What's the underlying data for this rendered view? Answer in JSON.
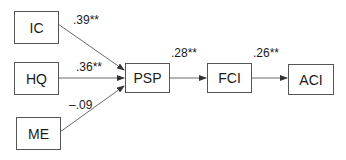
{
  "nodes": {
    "ic": "IC",
    "hq": "HQ",
    "me": "ME",
    "psp": "PSP",
    "fci": "FCI",
    "aci": "ACI"
  },
  "edges": [
    {
      "from": "IC",
      "to": "PSP",
      "coef": ".39**"
    },
    {
      "from": "HQ",
      "to": "PSP",
      "coef": ".36**"
    },
    {
      "from": "ME",
      "to": "PSP",
      "coef": "–.09"
    },
    {
      "from": "PSP",
      "to": "FCI",
      "coef": ".28**"
    },
    {
      "from": "FCI",
      "to": "ACI",
      "coef": ".26**"
    }
  ]
}
